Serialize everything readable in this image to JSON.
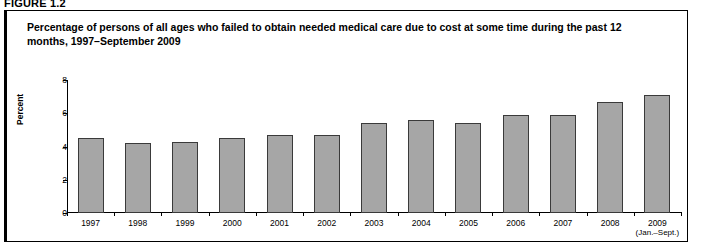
{
  "figure": {
    "label": "FIGURE 1.2",
    "title": "Percentage of persons of all ages who failed to obtain needed medical care due to cost at some time during the past 12 months, 1997–September 2009"
  },
  "chart_data": {
    "type": "bar",
    "title": "Percentage of persons of all ages who failed to obtain needed medical care due to cost at some time during the past 12 months, 1997–September 2009",
    "xlabel": "",
    "ylabel": "Percent",
    "ylim": [
      0,
      8
    ],
    "yticks": [
      0,
      2,
      4,
      6,
      8
    ],
    "ytick_labels": [
      "0",
      "2",
      "4",
      "6",
      "8"
    ],
    "grid": false,
    "legend": false,
    "bar_color": "#a6a6a6",
    "bar_edge_color": "#3a3a3a",
    "categories": [
      "1997",
      "1998",
      "1999",
      "2000",
      "2001",
      "2002",
      "2003",
      "2004",
      "2005",
      "2006",
      "2007",
      "2008",
      "2009"
    ],
    "category_sublabels": [
      "",
      "",
      "",
      "",
      "",
      "",
      "",
      "",
      "",
      "",
      "",
      "",
      "(Jan.–Sept.)"
    ],
    "values": [
      4.5,
      4.2,
      4.3,
      4.5,
      4.7,
      4.7,
      5.4,
      5.6,
      5.4,
      5.9,
      5.9,
      6.7,
      7.1
    ]
  }
}
